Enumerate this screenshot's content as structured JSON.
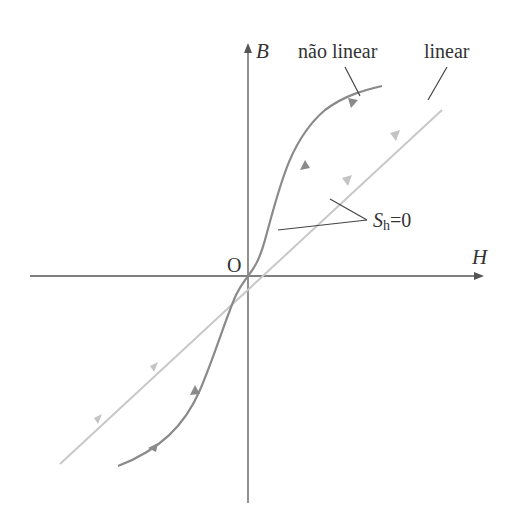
{
  "diagram": {
    "axes": {
      "x_label": "H",
      "y_label": "B",
      "origin_label": "O"
    },
    "curves": [
      {
        "name": "não linear",
        "label": "não linear",
        "color": "#8a8a8a"
      },
      {
        "name": "linear",
        "label": "linear",
        "color": "#c8c8c8"
      }
    ],
    "annotation": {
      "symbol": "S",
      "subscript": "h",
      "equals": "=0"
    },
    "colors": {
      "axis": "#555555",
      "leader": "#444444",
      "text": "#333333"
    }
  }
}
